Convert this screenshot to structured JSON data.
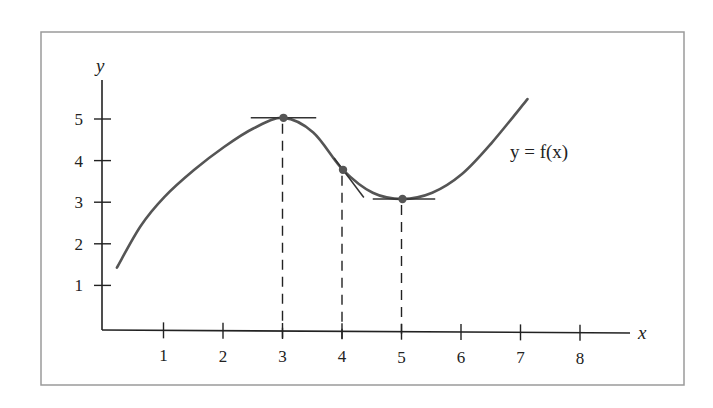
{
  "chart_data": {
    "type": "line",
    "title": "",
    "xlabel": "x",
    "ylabel": "y",
    "curve_label": "y = f(x)",
    "xlim": [
      0,
      8.7
    ],
    "ylim": [
      0,
      6.1
    ],
    "grid": false,
    "legend": "none",
    "x_ticks": [
      1,
      2,
      3,
      4,
      5,
      6,
      7,
      8
    ],
    "x_tick_labels": [
      "1",
      "2",
      "3",
      "4",
      "5",
      "6",
      "7",
      "8"
    ],
    "y_ticks": [
      1,
      2,
      3,
      4,
      5
    ],
    "y_tick_labels": [
      "1",
      "2",
      "3",
      "4",
      "5"
    ],
    "series": [
      {
        "name": "y = f(x)",
        "x": [
          0.2,
          0.6,
          1.0,
          1.5,
          2.0,
          2.5,
          3.0,
          3.5,
          4.0,
          4.5,
          5.0,
          5.5,
          6.0,
          6.5,
          7.1
        ],
        "y": [
          1.5,
          2.5,
          3.2,
          3.85,
          4.4,
          4.85,
          5.1,
          4.75,
          3.85,
          3.3,
          3.15,
          3.3,
          3.75,
          4.5,
          5.55
        ]
      }
    ],
    "annotations": [
      {
        "type": "point",
        "label": "local maximum",
        "x": 3,
        "y": 5.1
      },
      {
        "type": "point",
        "label": "inflection point",
        "x": 4,
        "y": 3.85
      },
      {
        "type": "point",
        "label": "local minimum",
        "x": 5,
        "y": 3.15
      },
      {
        "type": "tangent",
        "at_x": 3,
        "slope": 0,
        "from_x": 2.45,
        "to_x": 3.55
      },
      {
        "type": "tangent",
        "at_x": 4,
        "slope": -1.9,
        "from_x": 3.85,
        "to_x": 4.35
      },
      {
        "type": "tangent",
        "at_x": 5,
        "slope": 0,
        "from_x": 4.5,
        "to_x": 5.55
      },
      {
        "type": "dashed-drop-line",
        "x": 3
      },
      {
        "type": "dashed-drop-line",
        "x": 4
      },
      {
        "type": "dashed-drop-line",
        "x": 5
      }
    ],
    "colors": {
      "curve": "#555555",
      "axes": "#222222",
      "frame": "#9a9a9a",
      "points": "#555555"
    }
  }
}
